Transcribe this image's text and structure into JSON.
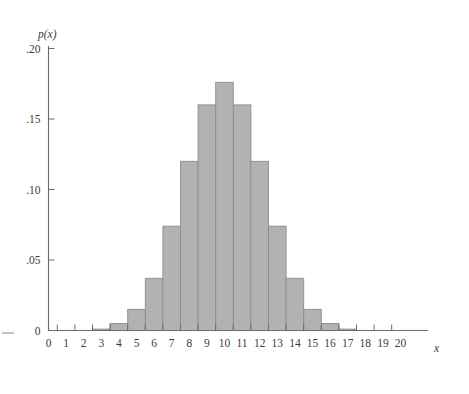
{
  "chart_data": {
    "type": "bar",
    "title": "",
    "subtitle": "",
    "xlabel": "x",
    "ylabel": "p(x)",
    "xlim": [
      -0.5,
      20.5
    ],
    "ylim": [
      0,
      0.2
    ],
    "grid": false,
    "legend": null,
    "bar_align": "center",
    "bar_width": 1,
    "x_tick_labels": [
      "0",
      "1",
      "2",
      "3",
      "4",
      "5",
      "6",
      "7",
      "8",
      "9",
      "10",
      "11",
      "12",
      "13",
      "14",
      "15",
      "16",
      "17",
      "18",
      "19",
      "20"
    ],
    "y_tick_labels": [
      "0",
      ".05",
      ".10",
      ".15",
      ".20"
    ],
    "y_tick_values": [
      0,
      0.05,
      0.1,
      0.15,
      0.2
    ],
    "categories": [
      0,
      1,
      2,
      3,
      4,
      5,
      6,
      7,
      8,
      9,
      10,
      11,
      12,
      13,
      14,
      15,
      16,
      17,
      18,
      19,
      20
    ],
    "values": [
      0,
      0,
      0,
      0.001,
      0.005,
      0.015,
      0.037,
      0.074,
      0.12,
      0.16,
      0.176,
      0.16,
      0.12,
      0.074,
      0.037,
      0.015,
      0.005,
      0.001,
      0,
      0,
      0
    ],
    "series": [
      {
        "name": "p(x)",
        "values": [
          0,
          0,
          0,
          0.001,
          0.005,
          0.015,
          0.037,
          0.074,
          0.12,
          0.16,
          0.176,
          0.16,
          0.12,
          0.074,
          0.037,
          0.015,
          0.005,
          0.001,
          0,
          0,
          0
        ]
      }
    ],
    "annotations": []
  },
  "style": {
    "bar_fill": "#b2b2b2",
    "bar_stroke": "#8d8d8d",
    "axis_color": "#6b6b6b",
    "text_color": "#3d3d3d",
    "background": "#ffffff"
  },
  "axis_labels": {
    "x_axis_name": "x",
    "y_axis_name": "p(x)"
  }
}
